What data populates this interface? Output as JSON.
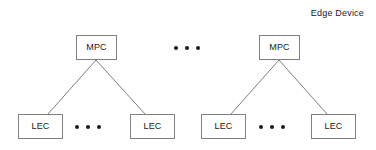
{
  "diagram": {
    "title": "Edge Device",
    "canvas": {
      "width": 376,
      "height": 150,
      "background": "#ffffff"
    },
    "style": {
      "box_border_color": "#808080",
      "box_fill_color": "#ffffff",
      "edge_color": "#808080",
      "text_color": "#1a1a1a",
      "dot_color": "#1a1a1a"
    },
    "groups": [
      {
        "name": "edge-device-group-left",
        "parent": {
          "label": "MPC",
          "x": 76,
          "y": 35,
          "width": 41,
          "height": 25
        },
        "children": [
          {
            "label": "LEC",
            "x": 18,
            "y": 114,
            "width": 45,
            "height": 25
          },
          {
            "label": "LEC",
            "x": 130,
            "y": 114,
            "width": 45,
            "height": 25
          }
        ],
        "child_ellipsis": {
          "x": 75,
          "y": 124,
          "dots": 3
        },
        "edges": [
          {
            "from": "MPC",
            "to": "LEC",
            "x1": 96,
            "y1": 60,
            "x2": 48,
            "y2": 114
          },
          {
            "from": "MPC",
            "to": "LEC",
            "x1": 96,
            "y1": 60,
            "x2": 145,
            "y2": 114
          }
        ]
      },
      {
        "name": "edge-device-group-right",
        "parent": {
          "label": "MPC",
          "x": 259,
          "y": 35,
          "width": 41,
          "height": 25
        },
        "children": [
          {
            "label": "LEC",
            "x": 201,
            "y": 114,
            "width": 45,
            "height": 25
          },
          {
            "label": "LEC",
            "x": 311,
            "y": 114,
            "width": 45,
            "height": 25
          }
        ],
        "child_ellipsis": {
          "x": 259,
          "y": 124,
          "dots": 3
        },
        "edges": [
          {
            "from": "MPC",
            "to": "LEC",
            "x1": 279,
            "y1": 60,
            "x2": 231,
            "y2": 114
          },
          {
            "from": "MPC",
            "to": "LEC",
            "x1": 279,
            "y1": 60,
            "x2": 327,
            "y2": 114
          }
        ]
      }
    ],
    "group_ellipsis": {
      "x": 174,
      "y": 45,
      "dots": 3
    }
  }
}
